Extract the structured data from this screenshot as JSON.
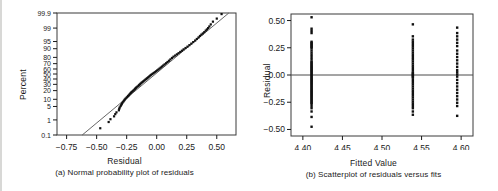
{
  "figure": {
    "background": "#ffffff",
    "ink": "#1a1a1a",
    "panels": [
      {
        "id": "a",
        "caption": "(a) Normal probability plot of residuals",
        "xlabel": "Residual",
        "ylabel": "Percent"
      },
      {
        "id": "b",
        "caption": "(b) Scatterplot of residuals versus fits",
        "xlabel": "Fitted Value",
        "ylabel": "Residual"
      }
    ]
  },
  "chart_data": [
    {
      "type": "scatter",
      "id": "normal-probability-plot",
      "title": "",
      "subtitle": "(a) Normal probability plot of residuals",
      "xlabel": "Residual",
      "ylabel": "Percent",
      "xlim": [
        -0.83,
        0.66
      ],
      "ylim_percent": [
        0.1,
        99.9
      ],
      "grid": false,
      "legend": null,
      "xticks": [
        -0.75,
        -0.5,
        -0.25,
        0.0,
        0.25,
        0.5
      ],
      "xticklabels": [
        "-0.75",
        "-0.50",
        "-0.25",
        "0.00",
        "0.25",
        "0.50"
      ],
      "yticks": [
        0.1,
        1,
        5,
        10,
        20,
        30,
        40,
        50,
        60,
        70,
        80,
        90,
        95,
        99,
        99.9
      ],
      "yticklabels": [
        "0.1",
        "1",
        "5",
        "10",
        "20",
        "30",
        "40",
        "50",
        "60",
        "70",
        "80",
        "90",
        "95",
        "99",
        "99.9"
      ],
      "reference_line": {
        "x": [
          -0.62,
          0.6
        ],
        "percent": [
          0.1,
          99.9
        ],
        "note": "straight fitted normal reference line"
      },
      "points": [
        {
          "x": -0.47,
          "p": 0.3
        },
        {
          "x": -0.4,
          "p": 0.75
        },
        {
          "x": -0.385,
          "p": 1.1
        },
        {
          "x": -0.355,
          "p": 1.6
        },
        {
          "x": -0.345,
          "p": 2.1
        },
        {
          "x": -0.335,
          "p": 2.6
        },
        {
          "x": -0.315,
          "p": 3.3
        },
        {
          "x": -0.312,
          "p": 3.9
        },
        {
          "x": -0.308,
          "p": 4.5
        },
        {
          "x": -0.3,
          "p": 5.2
        },
        {
          "x": -0.295,
          "p": 5.9
        },
        {
          "x": -0.29,
          "p": 6.6
        },
        {
          "x": -0.285,
          "p": 7.3
        },
        {
          "x": -0.278,
          "p": 8.1
        },
        {
          "x": -0.272,
          "p": 8.9
        },
        {
          "x": -0.266,
          "p": 9.7
        },
        {
          "x": -0.26,
          "p": 10.5
        },
        {
          "x": -0.252,
          "p": 11.4
        },
        {
          "x": -0.245,
          "p": 12.3
        },
        {
          "x": -0.238,
          "p": 13.2
        },
        {
          "x": -0.232,
          "p": 14.1
        },
        {
          "x": -0.226,
          "p": 15.1
        },
        {
          "x": -0.22,
          "p": 16.1
        },
        {
          "x": -0.214,
          "p": 17.1
        },
        {
          "x": -0.208,
          "p": 18.1
        },
        {
          "x": -0.2,
          "p": 19.2
        },
        {
          "x": -0.193,
          "p": 20.3
        },
        {
          "x": -0.186,
          "p": 21.4
        },
        {
          "x": -0.18,
          "p": 22.6
        },
        {
          "x": -0.174,
          "p": 23.8
        },
        {
          "x": -0.168,
          "p": 25.0
        },
        {
          "x": -0.16,
          "p": 26.2
        },
        {
          "x": -0.152,
          "p": 27.5
        },
        {
          "x": -0.146,
          "p": 28.8
        },
        {
          "x": -0.14,
          "p": 30.1
        },
        {
          "x": -0.133,
          "p": 31.5
        },
        {
          "x": -0.126,
          "p": 32.9
        },
        {
          "x": -0.118,
          "p": 34.3
        },
        {
          "x": -0.11,
          "p": 35.8
        },
        {
          "x": -0.102,
          "p": 37.3
        },
        {
          "x": -0.094,
          "p": 38.8
        },
        {
          "x": -0.086,
          "p": 40.3
        },
        {
          "x": -0.078,
          "p": 41.9
        },
        {
          "x": -0.07,
          "p": 43.5
        },
        {
          "x": -0.062,
          "p": 45.1
        },
        {
          "x": -0.054,
          "p": 46.8
        },
        {
          "x": -0.046,
          "p": 48.4
        },
        {
          "x": -0.036,
          "p": 50.1
        },
        {
          "x": -0.026,
          "p": 51.9
        },
        {
          "x": -0.016,
          "p": 53.6
        },
        {
          "x": -0.006,
          "p": 55.4
        },
        {
          "x": 0.004,
          "p": 57.2
        },
        {
          "x": 0.014,
          "p": 59.0
        },
        {
          "x": 0.024,
          "p": 60.9
        },
        {
          "x": 0.034,
          "p": 62.8
        },
        {
          "x": 0.044,
          "p": 64.7
        },
        {
          "x": 0.055,
          "p": 66.7
        },
        {
          "x": 0.066,
          "p": 68.7
        },
        {
          "x": 0.078,
          "p": 70.7
        },
        {
          "x": 0.09,
          "p": 72.8
        },
        {
          "x": 0.102,
          "p": 74.9
        },
        {
          "x": 0.114,
          "p": 77.0
        },
        {
          "x": 0.127,
          "p": 79.2
        },
        {
          "x": 0.14,
          "p": 81.0
        },
        {
          "x": 0.154,
          "p": 82.5
        },
        {
          "x": 0.168,
          "p": 84.0
        },
        {
          "x": 0.182,
          "p": 85.4
        },
        {
          "x": 0.196,
          "p": 86.8
        },
        {
          "x": 0.21,
          "p": 88.1
        },
        {
          "x": 0.224,
          "p": 89.4
        },
        {
          "x": 0.24,
          "p": 90.6
        },
        {
          "x": 0.256,
          "p": 91.7
        },
        {
          "x": 0.272,
          "p": 92.8
        },
        {
          "x": 0.288,
          "p": 93.8
        },
        {
          "x": 0.304,
          "p": 94.7
        },
        {
          "x": 0.32,
          "p": 95.5
        },
        {
          "x": 0.334,
          "p": 96.2
        },
        {
          "x": 0.348,
          "p": 96.8
        },
        {
          "x": 0.36,
          "p": 97.3
        },
        {
          "x": 0.372,
          "p": 97.7
        },
        {
          "x": 0.384,
          "p": 98.0
        },
        {
          "x": 0.396,
          "p": 98.3
        },
        {
          "x": 0.408,
          "p": 98.6
        },
        {
          "x": 0.418,
          "p": 98.8
        },
        {
          "x": 0.428,
          "p": 99.0
        },
        {
          "x": 0.438,
          "p": 99.2
        },
        {
          "x": 0.45,
          "p": 99.4
        },
        {
          "x": 0.468,
          "p": 99.6
        },
        {
          "x": 0.5,
          "p": 99.75
        },
        {
          "x": 0.54,
          "p": 99.88
        }
      ]
    },
    {
      "type": "scatter",
      "id": "residuals-vs-fits",
      "title": "",
      "subtitle": "(b) Scatterplot of residuals versus fits",
      "xlabel": "Fitted Value",
      "ylabel": "Residual",
      "xlim": [
        4.385,
        4.615
      ],
      "ylim": [
        -0.56,
        0.56
      ],
      "grid": false,
      "legend": null,
      "xticks": [
        4.4,
        4.45,
        4.5,
        4.55,
        4.6
      ],
      "xticklabels": [
        "4.40",
        "4.45",
        "4.50",
        "4.55",
        "4.60"
      ],
      "yticks": [
        -0.5,
        -0.25,
        0.0,
        0.25,
        0.5
      ],
      "yticklabels": [
        "-0.50",
        "-0.25",
        "0.00",
        "0.25",
        "0.50"
      ],
      "zero_line": 0.0,
      "groups": [
        {
          "fitted": 4.411,
          "residuals": [
            0.53,
            0.425,
            0.405,
            0.385,
            0.305,
            0.295,
            0.285,
            0.275,
            0.265,
            0.255,
            0.245,
            0.225,
            0.205,
            0.185,
            0.165,
            0.145,
            0.125,
            0.115,
            0.105,
            0.095,
            0.085,
            0.075,
            0.065,
            0.055,
            0.045,
            0.035,
            0.025,
            0.015,
            0.005,
            -0.005,
            -0.015,
            -0.025,
            -0.035,
            -0.045,
            -0.055,
            -0.065,
            -0.075,
            -0.085,
            -0.095,
            -0.105,
            -0.115,
            -0.125,
            -0.135,
            -0.145,
            -0.155,
            -0.165,
            -0.175,
            -0.185,
            -0.195,
            -0.205,
            -0.215,
            -0.225,
            -0.235,
            -0.245,
            -0.255,
            -0.265,
            -0.285,
            -0.305,
            -0.335,
            -0.385,
            -0.475
          ]
        },
        {
          "fitted": 4.539,
          "residuals": [
            0.465,
            0.355,
            0.325,
            0.305,
            0.285,
            0.265,
            0.245,
            0.225,
            0.205,
            0.185,
            0.165,
            0.145,
            0.125,
            0.105,
            0.085,
            0.065,
            0.045,
            0.025,
            0.015,
            0.005,
            -0.005,
            -0.015,
            -0.025,
            -0.045,
            -0.065,
            -0.085,
            -0.105,
            -0.125,
            -0.145,
            -0.165,
            -0.185,
            -0.205,
            -0.225,
            -0.245,
            -0.265,
            -0.285,
            -0.305,
            -0.335,
            -0.365
          ]
        },
        {
          "fitted": 4.595,
          "residuals": [
            0.435,
            0.385,
            0.355,
            0.325,
            0.295,
            0.265,
            0.225,
            0.195,
            0.165,
            0.135,
            0.105,
            0.075,
            0.045,
            0.025,
            0.005,
            -0.015,
            -0.045,
            -0.075,
            -0.105,
            -0.135,
            -0.165,
            -0.195,
            -0.225,
            -0.255,
            -0.285,
            -0.375
          ]
        }
      ]
    }
  ]
}
